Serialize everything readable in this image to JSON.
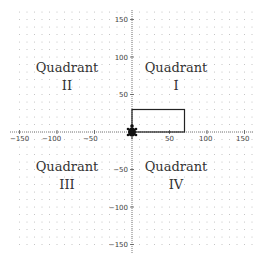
{
  "diagram": {
    "type": "coordinate-plane",
    "x_range": [
      -150,
      150
    ],
    "y_range": [
      -150,
      150
    ],
    "grid_step": 10,
    "label_step": 50,
    "x_tick_labels": [
      "−150",
      "−100",
      "−50",
      "50",
      "100",
      "150"
    ],
    "y_tick_labels": [
      "150",
      "100",
      "50",
      "−50",
      "−100",
      "−150"
    ],
    "quadrants": [
      {
        "name": "Quadrant",
        "numeral": "I"
      },
      {
        "name": "Quadrant",
        "numeral": "II"
      },
      {
        "name": "Quadrant",
        "numeral": "III"
      },
      {
        "name": "Quadrant",
        "numeral": "IV"
      }
    ],
    "rectangle": {
      "x": 0,
      "y": 0,
      "width": 70,
      "height": 30
    },
    "origin_marker": "turtle-icon",
    "colors": {
      "axis": "#555555",
      "grid_dot": "#bbbbbb",
      "rectangle": "#222222",
      "text": "#333333"
    }
  }
}
